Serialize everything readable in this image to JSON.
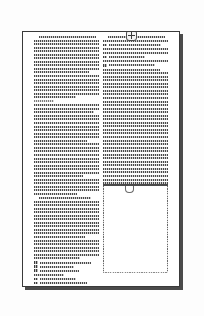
{
  "viewer": {
    "kind": "document-page-thumbnail",
    "page_background": "#ffffff",
    "canvas_background": "#fdfdfd",
    "border_color": "#3a3a3a",
    "shadow_color": "#2b2b2b",
    "ink_color": "#4a4a4a"
  },
  "page": {
    "layout": "two-column",
    "column_count": 2
  },
  "logo": {
    "icon": "plus-badge-icon",
    "label": ""
  },
  "columns": {
    "left": {
      "blocks": [
        {
          "type": "paragraph",
          "indent_first": true,
          "lines": [
            96,
            100,
            100,
            100,
            100,
            100,
            100,
            100,
            100,
            100,
            84,
            100,
            100,
            100,
            100,
            100,
            100,
            64
          ]
        },
        {
          "type": "paragraph",
          "indent_first": false,
          "lines": [
            30
          ]
        },
        {
          "type": "paragraph",
          "indent_first": false,
          "lines": [
            100,
            100,
            92,
            100,
            100,
            100,
            100,
            100,
            100,
            100,
            82,
            100,
            100,
            100,
            100,
            100,
            100,
            100,
            100,
            100,
            76,
            100,
            100,
            100,
            100,
            66
          ]
        },
        {
          "type": "paragraph",
          "indent_first": true,
          "lines": [
            88,
            100,
            100,
            100,
            100,
            100,
            100,
            100,
            100,
            100,
            100,
            78,
            100,
            100,
            100,
            100,
            100,
            70
          ]
        },
        {
          "type": "list",
          "items": [
            {
              "marker": "bullet",
              "width": 78
            },
            {
              "marker": "bullet",
              "width": 52
            },
            {
              "marker": "bullet",
              "width": 60
            }
          ]
        },
        {
          "type": "paragraph",
          "indent_first": false,
          "lines": [
            46
          ]
        },
        {
          "type": "list",
          "items": [
            {
              "marker": "bullet",
              "width": 56
            },
            {
              "marker": "bullet",
              "width": 72
            }
          ]
        },
        {
          "type": "paragraph",
          "indent_first": false,
          "lines": [
            28
          ]
        },
        {
          "type": "list",
          "items": [
            {
              "marker": "bullet",
              "width": 62
            },
            {
              "marker": "bullet",
              "width": 66
            }
          ]
        }
      ]
    },
    "right": {
      "blocks": [
        {
          "type": "paragraph",
          "indent_first": true,
          "lines": [
            96,
            100
          ]
        },
        {
          "type": "list",
          "items": [
            {
              "marker": "bullet",
              "width": 80
            }
          ]
        },
        {
          "type": "paragraph",
          "indent_first": false,
          "lines": [
            100,
            100
          ]
        },
        {
          "type": "list",
          "items": [
            {
              "marker": "bullet",
              "width": 56
            }
          ]
        },
        {
          "type": "paragraph",
          "indent_first": false,
          "lines": [
            100
          ]
        },
        {
          "type": "list",
          "items": [
            {
              "marker": "bullet",
              "width": 70
            }
          ]
        },
        {
          "type": "paragraph",
          "indent_first": false,
          "lines": [
            88,
            100,
            100,
            100,
            100,
            100,
            100,
            100,
            100,
            100,
            100,
            100,
            100,
            100,
            100,
            100,
            100,
            100,
            100,
            100,
            100,
            100,
            100,
            100,
            100,
            100,
            100,
            100,
            100,
            100,
            100,
            100,
            100,
            100,
            100,
            100,
            100,
            100,
            100
          ]
        },
        {
          "type": "paragraph",
          "indent_first": false,
          "lines": [
            26
          ]
        }
      ]
    }
  },
  "figure": {
    "name": "figure-plate",
    "has_top_rule": true,
    "has_tab": true,
    "tab_shape": "u-bracket",
    "body": "blank",
    "border_style": "dashed"
  }
}
